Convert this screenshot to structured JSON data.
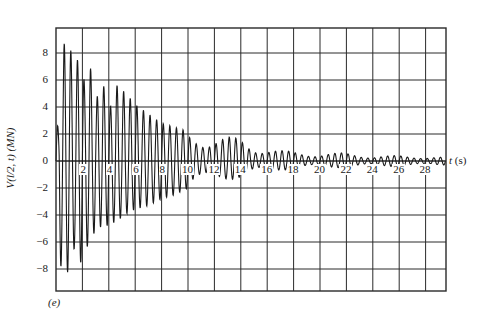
{
  "chart_data": {
    "type": "line",
    "title": "",
    "panel_label": "(e)",
    "xlabel": "t (s)",
    "ylabel": "V(l/2, t) (MN)",
    "xlim": [
      0,
      29.5
    ],
    "ylim": [
      -9.6,
      9.6
    ],
    "grid": true,
    "legend": null,
    "x_ticks": [
      2,
      4,
      6,
      8,
      10,
      12,
      14,
      16,
      18,
      20,
      22,
      24,
      26,
      28
    ],
    "y_ticks": [
      8,
      6,
      4,
      2,
      0,
      -2,
      -4,
      -6,
      -8
    ],
    "envelope": {
      "t": [
        0.2,
        0.6,
        1.0,
        1.4,
        1.8,
        2.2,
        2.6,
        3.0,
        3.5,
        4.0,
        4.5,
        5.0,
        5.5,
        6.0,
        7.0,
        8.0,
        9.0,
        10.0,
        11.0,
        12.0,
        13.0,
        14.0,
        15.0,
        16.0,
        17.0,
        18.0,
        20.0,
        22.0,
        24.0,
        26.0,
        28.0,
        29.5
      ],
      "upper": [
        2.6,
        8.7,
        8.7,
        7.0,
        7.9,
        5.6,
        7.0,
        4.3,
        6.2,
        3.5,
        5.7,
        5.3,
        4.8,
        4.2,
        3.5,
        2.8,
        2.5,
        2.2,
        2.0,
        1.9,
        1.8,
        1.7,
        1.2,
        1.0,
        0.8,
        0.7,
        0.6,
        0.6,
        0.4,
        0.4,
        0.35,
        0.3
      ],
      "lower": [
        -8.3,
        -7.2,
        -8.7,
        -6.4,
        -7.7,
        -6.8,
        -5.8,
        -5.2,
        -4.8,
        -4.8,
        -4.5,
        -4.2,
        -3.8,
        -3.6,
        -3.3,
        -2.8,
        -2.5,
        -2.0,
        -1.8,
        -1.5,
        -1.4,
        -1.3,
        -1.0,
        -0.9,
        -0.7,
        -0.6,
        -0.5,
        -0.5,
        -0.4,
        -0.4,
        -0.35,
        -0.3
      ]
    },
    "oscillation_period_s": 0.5
  },
  "labels": {
    "y_ticks": [
      "8",
      "6",
      "4",
      "2",
      "0",
      "−2",
      "−4",
      "−6",
      "−8"
    ],
    "x_ticks": [
      "2",
      "4",
      "6",
      "8",
      "10",
      "12",
      "14",
      "16",
      "18",
      "20",
      "22",
      "24",
      "26",
      "28"
    ],
    "ylabel": "V(l/2, t) (MN)",
    "xlabel_var": "t",
    "xlabel_unit": " (s)",
    "panel": "(e)"
  },
  "colors": {
    "ink": "#1a1a1a",
    "grid": "#2a2a2a",
    "background": "#ffffff"
  }
}
